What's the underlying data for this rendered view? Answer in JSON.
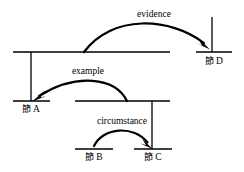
{
  "diagram": {
    "type": "rst-discourse-tree",
    "background_color": "#ffffff",
    "stroke_color": "#000000",
    "relations": [
      {
        "id": "evidence",
        "label": "evidence",
        "satellite": "top-level-span",
        "nucleus": "node-d",
        "label_x": 154,
        "label_y": 17
      },
      {
        "id": "example",
        "label": "example",
        "satellite": "mid-level-span",
        "nucleus": "node-a",
        "label_x": 88,
        "label_y": 74
      },
      {
        "id": "circumstance",
        "label": "circumstance",
        "satellite": "node-b",
        "nucleus": "node-c",
        "label_x": 122,
        "label_y": 124
      }
    ],
    "nodes": [
      {
        "id": "node-a",
        "label_cjk": "節",
        "label_latin": "A",
        "label_x": 31,
        "label_y": 112
      },
      {
        "id": "node-b",
        "label_cjk": "節",
        "label_latin": "B",
        "label_x": 94,
        "label_y": 160
      },
      {
        "id": "node-c",
        "label_cjk": "節",
        "label_latin": "C",
        "label_x": 153,
        "label_y": 160
      },
      {
        "id": "node-d",
        "label_cjk": "節",
        "label_latin": "D",
        "label_x": 214,
        "label_y": 64
      }
    ],
    "spans": [
      {
        "id": "top-level-span",
        "x1": 13,
        "x2": 170,
        "y": 52
      },
      {
        "id": "node-d-span",
        "x1": 196,
        "x2": 232,
        "y": 52
      },
      {
        "id": "node-a-span",
        "x1": 13,
        "x2": 50,
        "y": 101
      },
      {
        "id": "mid-level-span",
        "x1": 75,
        "x2": 170,
        "y": 101
      },
      {
        "id": "node-b-span",
        "x1": 75,
        "x2": 113,
        "y": 149
      },
      {
        "id": "node-c-span",
        "x1": 134,
        "x2": 172,
        "y": 149
      }
    ],
    "stems": [
      {
        "id": "stem-top-to-a",
        "x": 31,
        "y1": 52,
        "y2": 101
      },
      {
        "id": "stem-mid-to-c",
        "x": 152,
        "y1": 101,
        "y2": 149
      },
      {
        "id": "stem-d-nucleus",
        "x": 212,
        "y1": 17,
        "y2": 52
      }
    ],
    "arcs": [
      {
        "id": "arc-evidence",
        "path": "M 84 52 C 112 14, 168 18, 205 45",
        "stroke_width": 2.1
      },
      {
        "id": "arc-example",
        "path": "M 127 101 C 114 78, 78 74, 38 97",
        "stroke_width": 2.1
      },
      {
        "id": "arc-circumstance",
        "path": "M 94 146 C 103 128, 133 126, 148 144",
        "stroke_width": 2.1
      }
    ],
    "arrowheads": [
      {
        "id": "arrowhead-evidence",
        "target": "node-d",
        "points": "205,45 196,36 200,45 196,48",
        "x": 207,
        "y": 48,
        "angle": 40
      },
      {
        "id": "arrowhead-example",
        "target": "node-a",
        "points": "",
        "x": 36,
        "y": 99,
        "angle": 215
      },
      {
        "id": "arrowhead-circumstance",
        "target": "node-c",
        "points": "",
        "x": 150,
        "y": 147,
        "angle": 55
      }
    ]
  }
}
